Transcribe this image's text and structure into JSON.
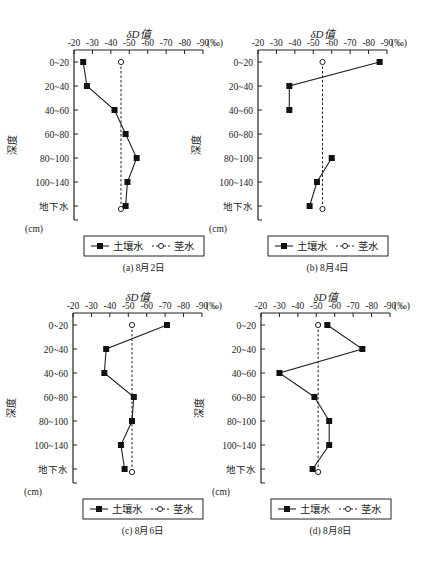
{
  "figure": {
    "xlabel": "δD值",
    "unit": "(‰)",
    "depth_label": "深度",
    "depth_unit": "(cm)",
    "x_ticks": [
      "-20",
      "-30",
      "-40",
      "-50",
      "-60",
      "-70",
      "-80",
      "-90"
    ],
    "y_ticks": [
      "0~20",
      "20~40",
      "40~60",
      "60~80",
      "80~100",
      "100~140",
      "地下水"
    ],
    "legend": {
      "soil": "土壤水",
      "stem": "茎水"
    }
  },
  "chart_data": [
    {
      "type": "line",
      "title": "(a) 8月2日",
      "xlabel": "δD值 (‰)",
      "ylabel": "深度 (cm)",
      "xlim": [
        -20,
        -90
      ],
      "categories": [
        "0~20",
        "20~40",
        "40~60",
        "60~80",
        "80~100",
        "100~140",
        "地下水"
      ],
      "series": [
        {
          "name": "土壤水",
          "marker": "filled-square",
          "line": "solid",
          "values": [
            -25,
            -27,
            -42,
            -48,
            -54,
            -49,
            -48
          ]
        },
        {
          "name": "茎水",
          "marker": "open-circle",
          "line": "dashed",
          "values": [
            -45.5,
            null,
            null,
            null,
            null,
            null,
            -45.5
          ]
        }
      ]
    },
    {
      "type": "line",
      "title": "(b) 8月4日",
      "xlabel": "δD值 (‰)",
      "ylabel": "深度 (cm)",
      "xlim": [
        -20,
        -90
      ],
      "categories": [
        "0~20",
        "20~40",
        "40~60",
        "60~80",
        "80~100",
        "100~140",
        "地下水"
      ],
      "series": [
        {
          "name": "土壤水",
          "marker": "filled-square",
          "line": "solid",
          "values": [
            -86,
            -37,
            -37,
            null,
            -60,
            -52,
            -48
          ]
        },
        {
          "name": "茎水",
          "marker": "open-circle",
          "line": "dashed",
          "values": [
            -55,
            null,
            null,
            null,
            null,
            null,
            -55
          ]
        }
      ]
    },
    {
      "type": "line",
      "title": "(c) 8月6日",
      "xlabel": "δD值 (‰)",
      "ylabel": "深度 (cm)",
      "xlim": [
        -20,
        -90
      ],
      "categories": [
        "0~20",
        "20~40",
        "40~60",
        "60~80",
        "80~100",
        "100~140",
        "地下水"
      ],
      "series": [
        {
          "name": "土壤水",
          "marker": "filled-square",
          "line": "solid",
          "values": [
            -71,
            -38,
            -37,
            -53,
            -52,
            -46,
            -48
          ]
        },
        {
          "name": "茎水",
          "marker": "open-circle",
          "line": "dashed",
          "values": [
            -52,
            null,
            null,
            null,
            null,
            null,
            -52
          ]
        }
      ]
    },
    {
      "type": "line",
      "title": "(d) 8月8日",
      "xlabel": "δD值 (‰)",
      "ylabel": "深度 (cm)",
      "xlim": [
        -20,
        -90
      ],
      "categories": [
        "0~20",
        "20~40",
        "40~60",
        "60~80",
        "80~100",
        "100~140",
        "地下水"
      ],
      "series": [
        {
          "name": "土壤水",
          "marker": "filled-square",
          "line": "solid",
          "values": [
            -56,
            -75,
            -30,
            -49,
            -57,
            -57,
            -48
          ]
        },
        {
          "name": "茎水",
          "marker": "open-circle",
          "line": "dashed",
          "values": [
            -51,
            null,
            null,
            null,
            null,
            null,
            -51
          ]
        }
      ]
    }
  ]
}
